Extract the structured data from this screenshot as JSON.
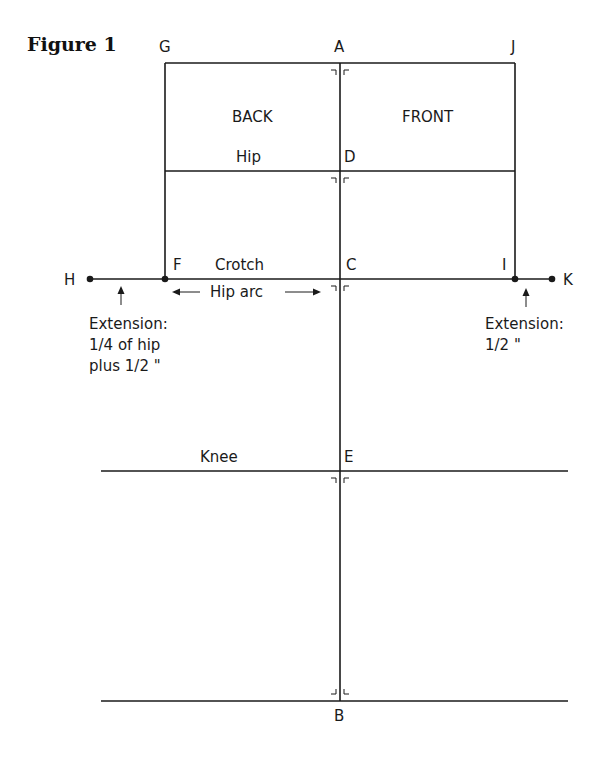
{
  "figure": {
    "title": "Figure 1"
  },
  "points": {
    "A": "A",
    "B": "B",
    "C": "C",
    "D": "D",
    "E": "E",
    "F": "F",
    "G": "G",
    "H": "H",
    "I": "I",
    "J": "J",
    "K": "K"
  },
  "labels": {
    "back": "BACK",
    "front": "FRONT",
    "hip": "Hip",
    "crotch": "Crotch",
    "hip_arc": "Hip arc",
    "knee": "Knee"
  },
  "extensions": {
    "left": {
      "line1": "Extension:",
      "line2": "1/4 of hip",
      "line3": "plus 1/2 \""
    },
    "right": {
      "line1": "Extension:",
      "line2": "1/2 \""
    }
  }
}
